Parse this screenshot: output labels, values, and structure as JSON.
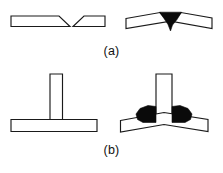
{
  "figure": {
    "background_color": "#ffffff",
    "line_color": "#1a1a1a",
    "weld_color": "#0a0a0a",
    "width": 223,
    "height": 173
  },
  "captions": {
    "a": "(a)",
    "b": "(b)"
  },
  "panels": [
    {
      "id": "panel-a",
      "caption": "(a)",
      "joint_type": "butt-joint-single-V-groove",
      "items": [
        {
          "id": "a-before",
          "state": "before-welding",
          "description": "Two flat plates with beveled edges forming a V groove, aligned horizontally",
          "parts": [
            "left-plate",
            "right-plate"
          ],
          "weld_beads": 0
        },
        {
          "id": "a-after",
          "state": "after-welding-angular-distortion",
          "description": "Both plates rotated upward about the weld line; V groove filled with weld metal",
          "parts": [
            "left-plate",
            "right-plate"
          ],
          "weld_beads": 1
        }
      ]
    },
    {
      "id": "panel-b",
      "caption": "(b)",
      "joint_type": "tee-joint-double-fillet-weld",
      "items": [
        {
          "id": "b-before",
          "state": "before-welding",
          "description": "Vertical web plate set square on a flat horizontal base plate",
          "parts": [
            "vertical-plate",
            "base-plate"
          ],
          "weld_beads": 0
        },
        {
          "id": "b-after",
          "state": "after-welding-angular-distortion",
          "description": "Base plate bowed upward toward the weld; two fillet welds deposited each side of the web",
          "parts": [
            "vertical-plate",
            "base-plate"
          ],
          "weld_beads": 2
        }
      ]
    }
  ],
  "geometry": {
    "a_before": {
      "left_plate_points": "11,16 59,16 70,26 11,26",
      "right_plate_points": "72,26 83,16 105,16 105,26"
    },
    "a_after": {
      "left_plate_points": "126,17 161,12 168,21 126,27",
      "right_plate_points": "172,21 179,12 212,17 212,28"
    },
    "a_weld_points": "160,12 181,12 176,20 171,30 166,20",
    "b_before": {
      "vertical_plate_points": "50,74 62,74 62,120 50,120",
      "base_plate_points": "11,119 97,119 97,131 11,131"
    },
    "b_after": {
      "vertical_plate_points": "156,74 172,74 172,123 156,123",
      "base_plate_points": "120,120 164,112 208,120 208,131 164,124 120,131",
      "weld_left_points": "156,108 156,123 140,123 136,119 140,111",
      "weld_right_points": "172,108 172,123 188,123 192,119 188,111"
    }
  }
}
